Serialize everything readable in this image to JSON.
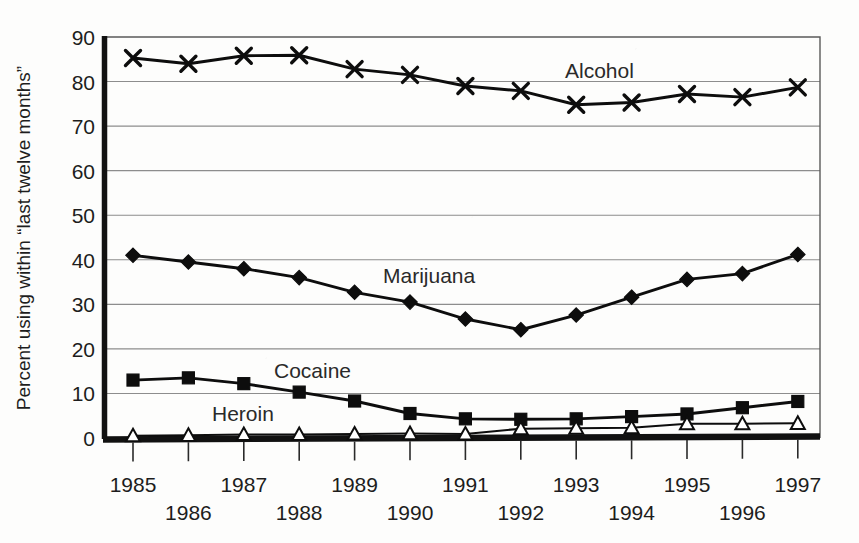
{
  "figure": {
    "ylabel": "Percent using within “last twelve months”",
    "background": "#fdfdfc",
    "ink_color": "#0d0d0d",
    "grid_color": "#8d8d8d"
  },
  "labels": {
    "alcohol": "Alcohol",
    "marijuana": "Marijuana",
    "cocaine": "Cocaine",
    "heroin": "Heroin"
  },
  "yticks": [
    "0",
    "10",
    "20",
    "30",
    "40",
    "50",
    "60",
    "70",
    "80",
    "90"
  ],
  "xticks_upper": [
    "1985",
    "1987",
    "1989",
    "1991",
    "1993",
    "1995",
    "1997"
  ],
  "xticks_lower": [
    "1986",
    "1988",
    "1990",
    "1992",
    "1994",
    "1996"
  ],
  "chart_data": {
    "type": "line",
    "title": "",
    "xlabel": "",
    "ylabel": "Percent using within “last twelve months”",
    "xlim": [
      1985,
      1997
    ],
    "ylim": [
      0,
      90
    ],
    "yticks": [
      0,
      10,
      20,
      30,
      40,
      50,
      60,
      70,
      80,
      90
    ],
    "grid": true,
    "grid_axis": "y",
    "legend": "inline-annotations",
    "categories": [
      1985,
      1986,
      1987,
      1988,
      1989,
      1990,
      1991,
      1992,
      1993,
      1994,
      1995,
      1996,
      1997
    ],
    "series": [
      {
        "name": "Alcohol",
        "marker": "x",
        "values": [
          85.3,
          84.0,
          85.8,
          85.9,
          82.8,
          81.5,
          79.0,
          77.9,
          74.8,
          75.3,
          77.2,
          76.5,
          78.7
        ]
      },
      {
        "name": "Marijuana",
        "marker": "diamond",
        "values": [
          41.0,
          39.5,
          38.0,
          36.0,
          32.7,
          30.5,
          26.7,
          24.3,
          27.6,
          31.6,
          35.6,
          36.9,
          41.2
        ]
      },
      {
        "name": "Cocaine",
        "marker": "square",
        "values": [
          13.0,
          13.5,
          12.2,
          10.3,
          8.3,
          5.5,
          4.3,
          4.2,
          4.3,
          4.8,
          5.4,
          6.8,
          8.2
        ]
      },
      {
        "name": "Heroin",
        "marker": "triangle",
        "values": [
          0.5,
          0.6,
          0.8,
          0.8,
          0.9,
          1.0,
          0.9,
          2.1,
          2.2,
          2.3,
          3.2,
          3.2,
          3.3
        ]
      }
    ]
  },
  "geometry": {
    "plot_left": 103,
    "plot_right": 820,
    "plot_top": 37,
    "plot_bottom": 438,
    "x_first": 133,
    "x_step": 55.4
  }
}
